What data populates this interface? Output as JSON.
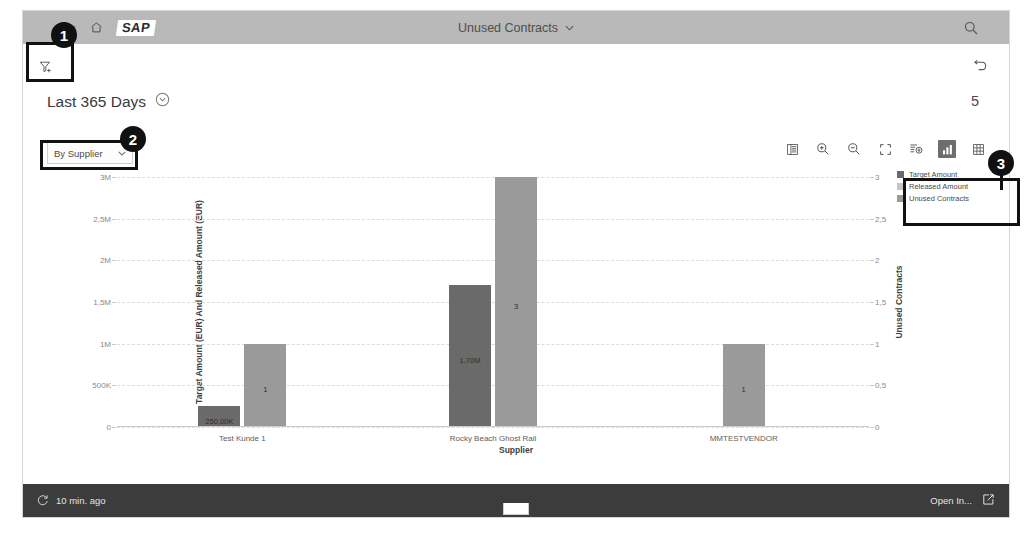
{
  "shell": {
    "back_label": "Back",
    "home_label": "Home",
    "logo_text": "SAP",
    "app_title": "Unused Contracts",
    "title_caret": "⌄",
    "search_label": "Search"
  },
  "page": {
    "filter_label": "Filter",
    "undo_label": "Undo",
    "kpi_title": "Last 365 Days",
    "kpi_count": "5"
  },
  "chart_toolbar": {
    "dimension_value": "By Supplier",
    "dimension_caret": "⌄",
    "icons": [
      {
        "name": "details-icon",
        "label": "Details"
      },
      {
        "name": "zoom-in-icon",
        "label": "Zoom In"
      },
      {
        "name": "zoom-out-icon",
        "label": "Zoom Out"
      },
      {
        "name": "fullscreen-icon",
        "label": "Full Screen"
      },
      {
        "name": "drill-down-icon",
        "label": "Drill Down"
      },
      {
        "name": "chart-view-icon",
        "label": "Chart View"
      },
      {
        "name": "table-view-icon",
        "label": "Table View"
      }
    ]
  },
  "legend": {
    "items": [
      {
        "label": "Target Amount",
        "color": "#6a6a6a"
      },
      {
        "label": "Released Amount",
        "color": "#c6c6c6"
      },
      {
        "label": "Unused Contracts",
        "color": "#9a9a9a"
      }
    ]
  },
  "footer": {
    "refresh_text": "10 min. ago",
    "open_in_text": "Open In...",
    "open_in_icon": "external-link-icon",
    "refresh_icon": "refresh-icon"
  },
  "annotations": [
    {
      "number": "1",
      "target": "filter-button"
    },
    {
      "number": "2",
      "target": "dimension-select"
    },
    {
      "number": "3",
      "target": "chart-legend"
    }
  ],
  "chart_data": {
    "type": "bar",
    "title": "",
    "xlabel": "Supplier",
    "ylabel": "Target Amount (EUR) And Released Amount (EUR)",
    "y2label": "Unused Contracts",
    "categories": [
      "Test Kunde 1",
      "Rocky Beach Ghost Rail",
      "MMTESTVENDOR"
    ],
    "ylim": [
      0,
      3000000
    ],
    "y2lim": [
      0,
      3
    ],
    "yticks": [
      "0",
      "500K",
      "1M",
      "1,5M",
      "2M",
      "2,5M",
      "3M"
    ],
    "ytick_values": [
      0,
      500000,
      1000000,
      1500000,
      2000000,
      2500000,
      3000000
    ],
    "y2ticks": [
      "0",
      "0,5",
      "1",
      "1,5",
      "2",
      "2,5",
      "3"
    ],
    "y2tick_values": [
      0,
      0.5,
      1,
      1.5,
      2,
      2.5,
      3
    ],
    "grid": true,
    "legend_position": "right",
    "series": [
      {
        "name": "Target Amount",
        "axis": "left",
        "color": "#6a6a6a",
        "values": [
          250000,
          1700000,
          null
        ],
        "labels": [
          "250,00K",
          "1,70M",
          ""
        ]
      },
      {
        "name": "Unused Contracts",
        "axis": "right",
        "color": "#9a9a9a",
        "values": [
          1,
          3,
          1
        ],
        "labels": [
          "1",
          "3",
          "1"
        ]
      }
    ]
  }
}
